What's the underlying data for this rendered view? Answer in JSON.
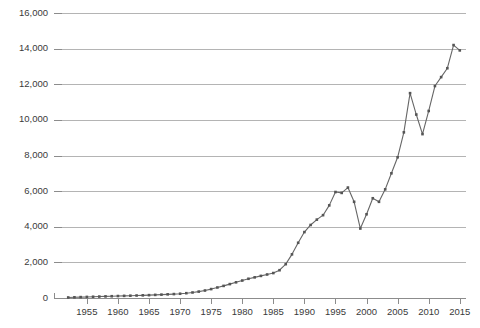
{
  "chart_data": {
    "type": "line",
    "title": "",
    "subtitle": "",
    "xlabel": "",
    "ylabel": "",
    "xlim": [
      1951,
      2016
    ],
    "ylim": [
      0,
      16000
    ],
    "grid": true,
    "legend": false,
    "legend_position": "none",
    "line_color": "#666666",
    "marker_color": "#555555",
    "gridline_color": "#b4b4b4",
    "axis_color": "#8c8c8c",
    "background_color": "#ffffff",
    "marker_shape": "square",
    "y_ticks": [
      0,
      2000,
      4000,
      6000,
      8000,
      10000,
      12000,
      14000,
      16000
    ],
    "y_tick_labels": [
      "0",
      "2,000",
      "4,000",
      "6,000",
      "8,000",
      "10,000",
      "12,000",
      "14,000",
      "16,000"
    ],
    "x_ticks": [
      1955,
      1960,
      1965,
      1970,
      1975,
      1980,
      1985,
      1990,
      1995,
      2000,
      2005,
      2010,
      2015
    ],
    "x_tick_labels": [
      "1955",
      "1960",
      "1965",
      "1970",
      "1975",
      "1980",
      "1985",
      "1990",
      "1995",
      "2000",
      "2005",
      "2010",
      "2015"
    ],
    "x": [
      1952,
      1953,
      1954,
      1955,
      1956,
      1957,
      1958,
      1959,
      1960,
      1961,
      1962,
      1963,
      1964,
      1965,
      1966,
      1967,
      1968,
      1969,
      1970,
      1971,
      1972,
      1973,
      1974,
      1975,
      1976,
      1977,
      1978,
      1979,
      1980,
      1981,
      1982,
      1983,
      1984,
      1985,
      1986,
      1987,
      1988,
      1989,
      1990,
      1991,
      1992,
      1993,
      1994,
      1995,
      1996,
      1997,
      1998,
      1999,
      2000,
      2001,
      2002,
      2003,
      2004,
      2005,
      2006,
      2007,
      2008,
      2009,
      2010,
      2011,
      2012,
      2013,
      2014,
      2015
    ],
    "values": [
      30,
      40,
      50,
      60,
      70,
      80,
      90,
      100,
      110,
      120,
      130,
      140,
      150,
      160,
      175,
      190,
      205,
      220,
      240,
      270,
      310,
      360,
      420,
      500,
      590,
      680,
      780,
      880,
      980,
      1080,
      1160,
      1240,
      1320,
      1400,
      1560,
      1900,
      2450,
      3100,
      3700,
      4100,
      4400,
      4650,
      5200,
      5950,
      5900,
      6200,
      5400,
      3900,
      4700,
      5600,
      5400,
      6100,
      7000,
      7900,
      9300,
      11500,
      10300,
      9200,
      10500,
      11900,
      12400,
      12900,
      14200,
      13900
    ],
    "series": [
      {
        "name": "series-1",
        "values": [
          30,
          40,
          50,
          60,
          70,
          80,
          90,
          100,
          110,
          120,
          130,
          140,
          150,
          160,
          175,
          190,
          205,
          220,
          240,
          270,
          310,
          360,
          420,
          500,
          590,
          680,
          780,
          880,
          980,
          1080,
          1160,
          1240,
          1320,
          1400,
          1560,
          1900,
          2450,
          3100,
          3700,
          4100,
          4400,
          4650,
          5200,
          5950,
          5900,
          6200,
          5400,
          3900,
          4700,
          5600,
          5400,
          6100,
          7000,
          7900,
          9300,
          11500,
          10300,
          9200,
          10500,
          11900,
          12400,
          12900,
          14200,
          13900
        ]
      }
    ],
    "annotations": []
  },
  "plot_geometry": {
    "left": 62,
    "right": 466,
    "top": 13,
    "bottom": 298
  }
}
